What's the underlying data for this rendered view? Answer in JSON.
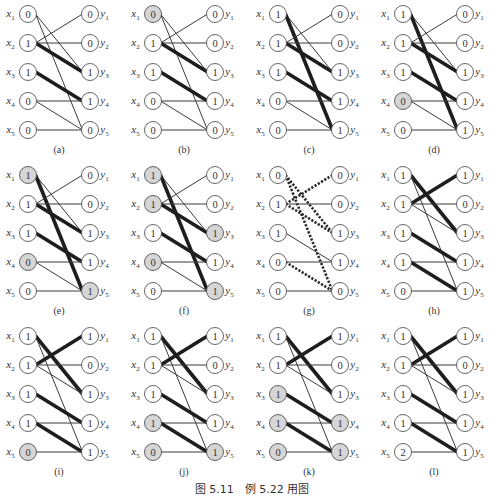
{
  "figure": {
    "caption": "图 5.11　例 5.22 用图",
    "colors": {
      "edge": "#3a3a3a",
      "node_stroke": "#555555",
      "node_fill": "#ffffff",
      "highlight_fill": "#d6d6d6",
      "text": "#333333"
    },
    "left_labels": [
      "x1",
      "x2",
      "x3",
      "x4",
      "x5"
    ],
    "right_labels": [
      "y1",
      "y2",
      "y3",
      "y4",
      "y5"
    ],
    "edges": [
      [
        1,
        3
      ],
      [
        1,
        5
      ],
      [
        2,
        1
      ],
      [
        2,
        2
      ],
      [
        2,
        3
      ],
      [
        3,
        4
      ],
      [
        4,
        4
      ],
      [
        4,
        5
      ],
      [
        5,
        5
      ]
    ],
    "panels": [
      {
        "label": "(a)",
        "x_values": [
          "0",
          "1",
          "1",
          "0",
          "0"
        ],
        "y_values": [
          "0",
          "0",
          "1",
          "1",
          "0"
        ],
        "x_highlight": [],
        "y_highlight": [],
        "thick_edges": [
          [
            2,
            3
          ],
          [
            3,
            4
          ]
        ],
        "dotted_edges": []
      },
      {
        "label": "(b)",
        "x_values": [
          "0",
          "1",
          "1",
          "0",
          "0"
        ],
        "y_values": [
          "0",
          "0",
          "1",
          "1",
          "0"
        ],
        "x_highlight": [
          1
        ],
        "y_highlight": [],
        "thick_edges": [
          [
            2,
            3
          ],
          [
            3,
            4
          ]
        ],
        "dotted_edges": []
      },
      {
        "label": "(c)",
        "x_values": [
          "1",
          "1",
          "1",
          "0",
          "0"
        ],
        "y_values": [
          "0",
          "0",
          "1",
          "1",
          "1"
        ],
        "x_highlight": [],
        "y_highlight": [],
        "thick_edges": [
          [
            1,
            5
          ],
          [
            2,
            3
          ],
          [
            3,
            4
          ]
        ],
        "dotted_edges": []
      },
      {
        "label": "(d)",
        "x_values": [
          "1",
          "1",
          "1",
          "0",
          "0"
        ],
        "y_values": [
          "0",
          "0",
          "1",
          "1",
          "1"
        ],
        "x_highlight": [
          4
        ],
        "y_highlight": [],
        "thick_edges": [
          [
            1,
            5
          ],
          [
            2,
            3
          ],
          [
            3,
            4
          ]
        ],
        "dotted_edges": []
      },
      {
        "label": "(e)",
        "x_values": [
          "1",
          "1",
          "1",
          "0",
          "0"
        ],
        "y_values": [
          "0",
          "0",
          "1",
          "1",
          "1"
        ],
        "x_highlight": [
          1,
          4
        ],
        "y_highlight": [
          5
        ],
        "thick_edges": [
          [
            1,
            5
          ],
          [
            2,
            3
          ],
          [
            3,
            4
          ]
        ],
        "dotted_edges": []
      },
      {
        "label": "(f)",
        "x_values": [
          "1",
          "1",
          "1",
          "0",
          "0"
        ],
        "y_values": [
          "0",
          "0",
          "1",
          "1",
          "1"
        ],
        "x_highlight": [
          1,
          2,
          4
        ],
        "y_highlight": [
          3,
          5
        ],
        "thick_edges": [
          [
            1,
            5
          ],
          [
            2,
            3
          ],
          [
            3,
            4
          ]
        ],
        "dotted_edges": []
      },
      {
        "label": "(g)",
        "x_values": [
          "0",
          "1",
          "1",
          "0",
          "0"
        ],
        "y_values": [
          "0",
          "0",
          "1",
          "1",
          "0"
        ],
        "x_highlight": [],
        "y_highlight": [],
        "thick_edges": [],
        "dotted_edges": [
          [
            1,
            3
          ],
          [
            1,
            5
          ],
          [
            2,
            1
          ],
          [
            2,
            3
          ],
          [
            4,
            5
          ]
        ]
      },
      {
        "label": "(h)",
        "x_values": [
          "1",
          "1",
          "1",
          "1",
          "0"
        ],
        "y_values": [
          "1",
          "0",
          "1",
          "1",
          "1"
        ],
        "x_highlight": [],
        "y_highlight": [],
        "thick_edges": [
          [
            1,
            3
          ],
          [
            2,
            1
          ],
          [
            3,
            4
          ],
          [
            4,
            5
          ]
        ],
        "dotted_edges": []
      },
      {
        "label": "(i)",
        "x_values": [
          "1",
          "1",
          "1",
          "1",
          "0"
        ],
        "y_values": [
          "1",
          "0",
          "1",
          "1",
          "1"
        ],
        "x_highlight": [
          5
        ],
        "y_highlight": [],
        "thick_edges": [
          [
            1,
            3
          ],
          [
            2,
            1
          ],
          [
            3,
            4
          ],
          [
            4,
            5
          ]
        ],
        "dotted_edges": []
      },
      {
        "label": "(j)",
        "x_values": [
          "1",
          "1",
          "1",
          "1",
          "0"
        ],
        "y_values": [
          "1",
          "0",
          "1",
          "1",
          "1"
        ],
        "x_highlight": [
          4,
          5
        ],
        "y_highlight": [
          5
        ],
        "thick_edges": [
          [
            1,
            3
          ],
          [
            2,
            1
          ],
          [
            3,
            4
          ],
          [
            4,
            5
          ]
        ],
        "dotted_edges": []
      },
      {
        "label": "(k)",
        "x_values": [
          "1",
          "1",
          "1",
          "1",
          "0"
        ],
        "y_values": [
          "1",
          "0",
          "1",
          "1",
          "1"
        ],
        "x_highlight": [
          3,
          4,
          5
        ],
        "y_highlight": [
          4,
          5
        ],
        "thick_edges": [
          [
            1,
            3
          ],
          [
            2,
            1
          ],
          [
            3,
            4
          ],
          [
            4,
            5
          ]
        ],
        "dotted_edges": []
      },
      {
        "label": "(l)",
        "x_values": [
          "1",
          "1",
          "1",
          "1",
          "2"
        ],
        "y_values": [
          "1",
          "0",
          "1",
          "1",
          "1"
        ],
        "x_highlight": [],
        "y_highlight": [],
        "thick_edges": [
          [
            1,
            3
          ],
          [
            2,
            1
          ],
          [
            3,
            4
          ],
          [
            4,
            5
          ]
        ],
        "dotted_edges": []
      }
    ]
  }
}
